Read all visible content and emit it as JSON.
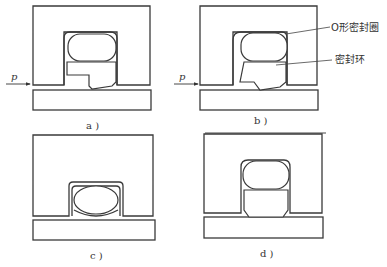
{
  "figure": {
    "panels": [
      {
        "id": "a",
        "caption": "a )",
        "pressure_label": "p",
        "pressure_arrow": true
      },
      {
        "id": "b",
        "caption": "b )",
        "pressure_label": "p",
        "pressure_arrow": true
      },
      {
        "id": "c",
        "caption": "c )",
        "pressure_label": null,
        "pressure_arrow": false
      },
      {
        "id": "d",
        "caption": "d )",
        "pressure_label": null,
        "pressure_arrow": false
      }
    ],
    "callouts": {
      "o_ring": "O形密封圈",
      "seal_ring": "密封环"
    },
    "colors": {
      "line": "#3a3a3a",
      "hatch": "#555555",
      "background": "#ffffff"
    }
  }
}
